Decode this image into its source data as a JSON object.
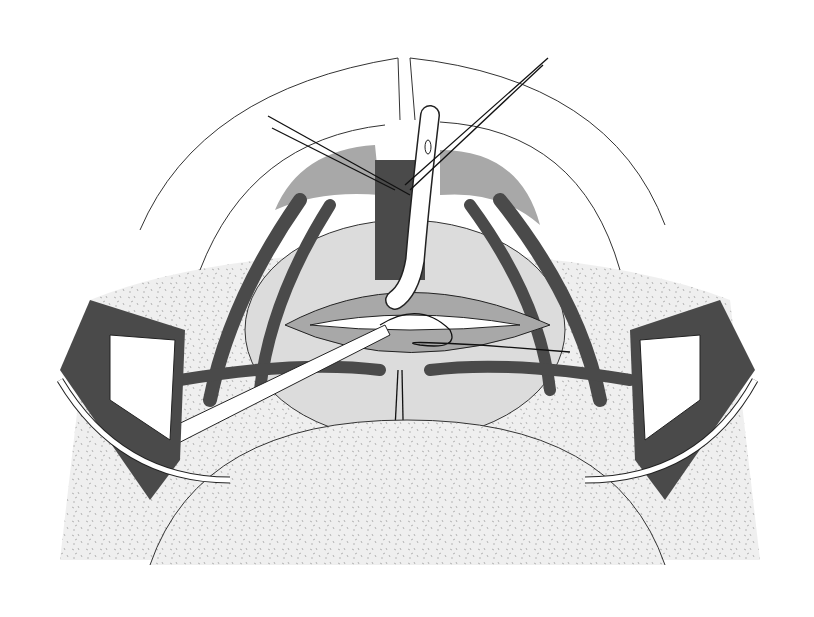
{
  "figure": {
    "type": "surgical-illustration",
    "style": "grayscale line art",
    "text": []
  },
  "colors": {
    "background": "#ffffff",
    "stipple_skin": "#ebebeb",
    "light_gray": "#dcdcdc",
    "mid_gray": "#a8a8a8",
    "muscle_dark": "#4a4a4a",
    "outline": "#222222"
  }
}
